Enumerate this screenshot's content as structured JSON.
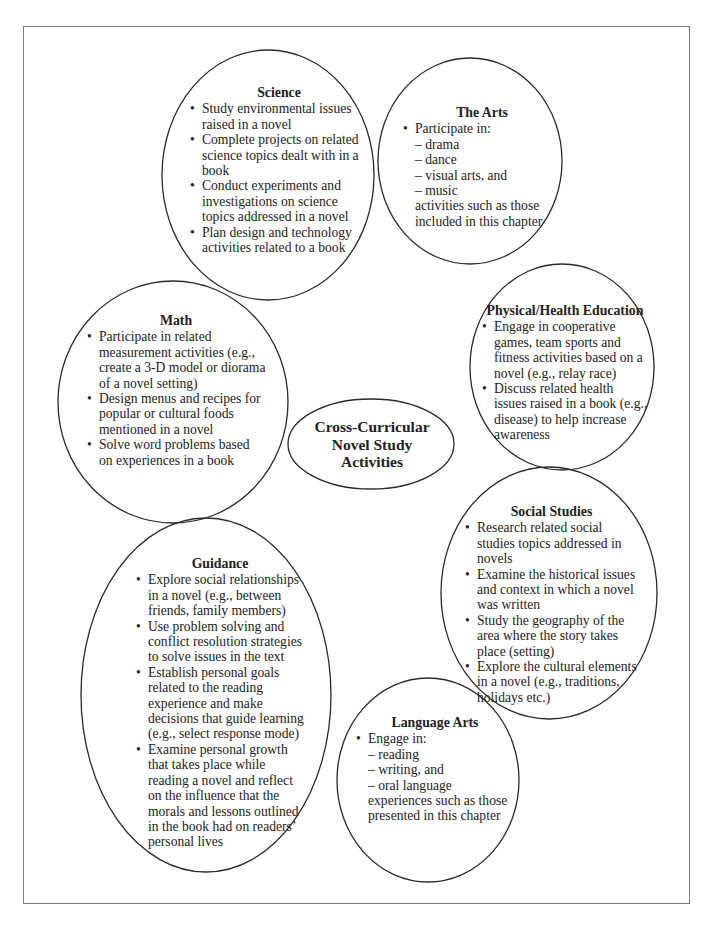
{
  "center": {
    "lines": [
      "Cross-Curricular",
      "Novel Study",
      "Activities"
    ]
  },
  "nodes": {
    "science": {
      "title": "Science",
      "bullets": [
        "Study environmental issues raised in a novel",
        "Complete projects on related science topics dealt with in a book",
        "Conduct experiments and investigations on science topics addressed in a novel",
        "Plan design and technology activities related to a book"
      ]
    },
    "arts": {
      "title": "The Arts",
      "bullet": "Participate in:",
      "subitems": [
        "– drama",
        "– dance",
        "– visual arts, and",
        "– music"
      ],
      "tail": [
        "activities such as those",
        "included in this chapter"
      ]
    },
    "math": {
      "title": "Math",
      "bullets": [
        "Participate in related measurement activities (e.g., create a 3-D model or diorama of a novel setting)",
        "Design menus and recipes for popular or cultural foods mentioned in a novel",
        "Solve word problems based on experiences in a book"
      ]
    },
    "phys_health": {
      "title": "Physical/Health Education",
      "bullets": [
        "Engage in cooperative games, team sports and fitness activities based on a novel (e.g., relay race)",
        "Discuss related health issues raised in a book (e.g., disease) to help increase awareness"
      ]
    },
    "social_studies": {
      "title": "Social Studies",
      "bullets": [
        "Research related social studies topics addressed in novels",
        "Examine the historical issues and context in which a novel was written",
        "Study the geography of the area where the story takes place (setting)",
        "Explore the cultural elements in a novel (e.g., traditions, holidays etc.)"
      ]
    },
    "guidance": {
      "title": "Guidance",
      "bullets": [
        "Explore social relationships in a novel (e.g., between friends, family members)",
        "Use problem solving and conflict resolution strategies to solve issues in the text",
        "Establish personal goals related to the reading experience and make decisions that guide learning (e.g., select response mode)",
        "Examine personal growth that takes place while reading a novel and reflect on the influence that the morals and lessons outlined in the book had on readers’ personal lives"
      ]
    },
    "language_arts": {
      "title": "Language Arts",
      "bullet": "Engage in:",
      "subitems": [
        "– reading",
        "– writing, and",
        "– oral language"
      ],
      "tail": [
        "experiences such as those",
        "presented in this chapter"
      ]
    }
  },
  "colors": {
    "outline": "#2a2a2a",
    "frame": "#7a7a7a",
    "text": "#222222",
    "background": "#ffffff"
  }
}
